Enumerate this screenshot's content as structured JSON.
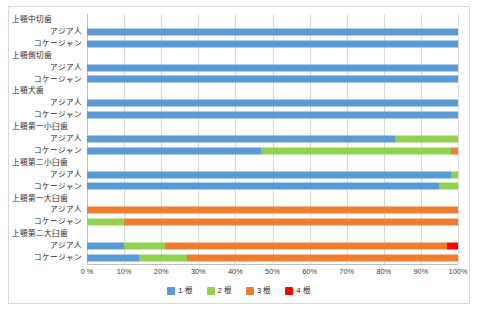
{
  "chart_data": {
    "type": "bar",
    "orientation": "horizontal",
    "stacked": "percent",
    "title": "",
    "xlabel": "",
    "ylabel": "",
    "xlim": [
      0,
      100
    ],
    "grid": true,
    "legend_position": "bottom",
    "xticks": [
      "0 %",
      "10%",
      "20%",
      "30%",
      "40%",
      "50%",
      "60%",
      "70%",
      "80%",
      "90%",
      "100%"
    ],
    "xtick_values": [
      0,
      10,
      20,
      30,
      40,
      50,
      60,
      70,
      80,
      90,
      100
    ],
    "legend": [
      {
        "name": "1 根",
        "color": "#5b9bd5"
      },
      {
        "name": "2 根",
        "color": "#92d050"
      },
      {
        "name": "3 根",
        "color": "#ed7d31"
      },
      {
        "name": "4 根",
        "color": "#ff0000"
      }
    ],
    "series": [
      {
        "name": "1 根",
        "color": "#5b9bd5"
      },
      {
        "name": "2 根",
        "color": "#92d050"
      },
      {
        "name": "3 根",
        "color": "#ed7d31"
      },
      {
        "name": "4 根",
        "color": "#ff0000"
      }
    ],
    "groups": [
      {
        "label": "上顎中切歯",
        "rows": [
          {
            "label": "アジア人",
            "values": [
              100,
              0,
              0,
              0
            ]
          },
          {
            "label": "コケージャン",
            "values": [
              100,
              0,
              0,
              0
            ]
          }
        ]
      },
      {
        "label": "上顎側切歯",
        "rows": [
          {
            "label": "アジア人",
            "values": [
              100,
              0,
              0,
              0
            ]
          },
          {
            "label": "コケージャン",
            "values": [
              100,
              0,
              0,
              0
            ]
          }
        ]
      },
      {
        "label": "上顎犬歯",
        "rows": [
          {
            "label": "アジア人",
            "values": [
              100,
              0,
              0,
              0
            ]
          },
          {
            "label": "コケージャン",
            "values": [
              100,
              0,
              0,
              0
            ]
          }
        ]
      },
      {
        "label": "上顎第一小臼歯",
        "rows": [
          {
            "label": "アジア人",
            "values": [
              83,
              17,
              0,
              0
            ]
          },
          {
            "label": "コケージャン",
            "values": [
              47,
              51,
              2,
              0
            ]
          }
        ]
      },
      {
        "label": "上顎第二小臼歯",
        "rows": [
          {
            "label": "アジア人",
            "values": [
              98,
              2,
              0,
              0
            ]
          },
          {
            "label": "コケージャン",
            "values": [
              95,
              5,
              0,
              0
            ]
          }
        ]
      },
      {
        "label": "上顎第一大臼歯",
        "rows": [
          {
            "label": "アジア人",
            "values": [
              0,
              0,
              100,
              0
            ]
          },
          {
            "label": "コケージャン",
            "values": [
              0,
              10,
              90,
              0
            ]
          }
        ]
      },
      {
        "label": "上顎第二大臼歯",
        "rows": [
          {
            "label": "アジア人",
            "values": [
              10,
              11,
              76,
              3
            ]
          },
          {
            "label": "コケージャン",
            "values": [
              14,
              13,
              73,
              0
            ]
          }
        ]
      }
    ]
  }
}
